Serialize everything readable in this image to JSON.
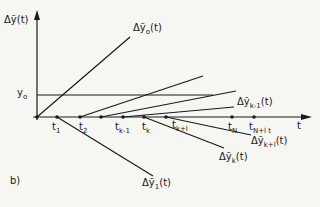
{
  "figure": {
    "panel_label": "b)",
    "y_axis_label": "Δỹ(t)",
    "x_axis_label": "t",
    "y0_label": "y",
    "y0_sub": "o"
  },
  "time_ticks": [
    {
      "main": "t",
      "sub": "1"
    },
    {
      "main": "t",
      "sub": "2"
    },
    {
      "main": "t",
      "sub": "k-1"
    },
    {
      "main": "t",
      "sub": "k"
    },
    {
      "main": "t",
      "sub": "k+l"
    },
    {
      "main": "t",
      "sub": "N"
    },
    {
      "main": "t",
      "sub": "N+l t"
    }
  ],
  "curve_labels": [
    {
      "prefix": "Δỹ",
      "sub": "o",
      "suffix": "(t)"
    },
    {
      "prefix": "Δỹ",
      "sub": "k-1",
      "suffix": "(t)"
    },
    {
      "prefix": "Δỹ",
      "sub": "k+l",
      "suffix": "(t)"
    },
    {
      "prefix": "Δỹ",
      "sub": "k",
      "suffix": "(t)"
    },
    {
      "prefix": "Δỹ",
      "sub": "1",
      "suffix": "(t)"
    }
  ],
  "colors": {
    "ink": "#1a1a1a",
    "paper": "#f6f6f3"
  }
}
